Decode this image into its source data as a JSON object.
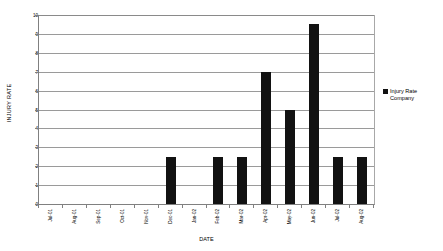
{
  "chart_data": {
    "type": "bar",
    "title": "",
    "xlabel": "DATE",
    "ylabel": "INJURY RATE",
    "categories": [
      "Jul-01",
      "Aug-01",
      "Sep-01",
      "Oct-01",
      "Nov-01",
      "Dec-01",
      "Jan-02",
      "Feb-02",
      "Mar-02",
      "Apr-02",
      "May-02",
      "Jun-02",
      "Jul-02",
      "Aug-02"
    ],
    "values": [
      0,
      0,
      0,
      0,
      0,
      2.5,
      0,
      2.5,
      2.5,
      7,
      5,
      9.5,
      2.5,
      2.5
    ],
    "series": [
      {
        "name": "Injury Rate Company",
        "values": [
          0,
          0,
          0,
          0,
          0,
          2.5,
          0,
          2.5,
          2.5,
          7,
          5,
          9.5,
          2.5,
          2.5
        ],
        "color": "#121212"
      }
    ],
    "ylim": [
      0,
      10
    ],
    "y_ticks": [
      0,
      1,
      2,
      3,
      4,
      5,
      6,
      7,
      8,
      9,
      10
    ],
    "y_tick_labels": [
      "0",
      "1",
      "2",
      "3",
      "4",
      "5",
      "6",
      "7",
      "8",
      "9",
      "10"
    ],
    "grid": "horizontal",
    "legend_position": "right",
    "legend_entries": [
      "Injury Rate Company"
    ],
    "bar_color": "#121212",
    "gridline_color": "#9a9a9a",
    "axis_color": "#808080",
    "background": "#ffffff"
  },
  "legend": {
    "label": "Injury Rate Company",
    "swatch_name": "legend-swatch-injury-rate"
  },
  "axes": {
    "y_title": "INJURY RATE",
    "x_title": "DATE"
  }
}
